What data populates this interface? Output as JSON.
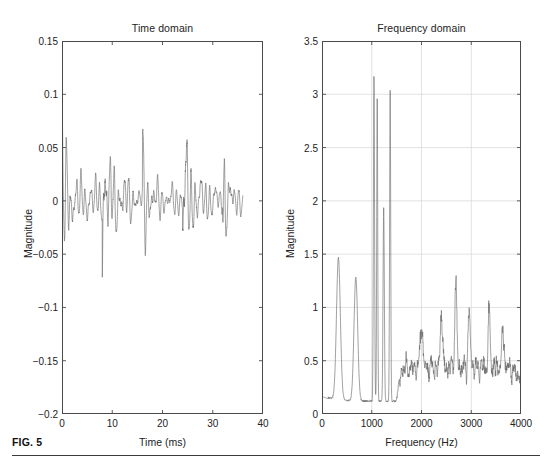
{
  "figure": {
    "caption_label": "FIG. 5",
    "background": "#ffffff",
    "line_color": "#6e6e6e",
    "axis_color": "#4a4a4a",
    "grid_color": "#d6d6d6",
    "text_color": "#232323"
  },
  "chart_data": [
    {
      "type": "line",
      "panel": "left",
      "title": "Time domain",
      "xlabel": "Time (ms)",
      "ylabel": "Magnitude",
      "xlim": [
        0,
        40
      ],
      "ylim": [
        -0.2,
        0.15
      ],
      "xticks": [
        0,
        10,
        20,
        30,
        40
      ],
      "xtick_labels": [
        "0",
        "10",
        "20",
        "30",
        "40"
      ],
      "yticks": [
        -0.2,
        -0.15,
        -0.1,
        -0.05,
        0,
        0.05,
        0.1,
        0.15
      ],
      "ytick_labels": [
        "-0.2",
        "-0.15",
        "-0.1",
        "-0.05",
        "0",
        "0.05",
        "0.1",
        "0.15"
      ],
      "grid": false,
      "series_name": "speech waveform",
      "x_sampling_ms": 0.075,
      "x_extent_ms": [
        0,
        36.0
      ],
      "description": "Dense oscillatory speech-like waveform, quasi-periodic pitch pulses, amplitude envelope between about -0.1 and +0.115, centered near 0.",
      "envelope_peaks_positive": [
        0.085,
        0.077,
        0.095,
        0.098,
        0.09,
        0.114,
        0.083,
        0.064,
        0.065,
        0.062,
        0.088,
        0.084,
        0.092,
        0.073,
        0.05
      ],
      "envelope_peaks_negative": [
        -0.055,
        -0.072,
        -0.063,
        -0.062,
        -0.088,
        -0.065,
        -0.1,
        -0.058,
        -0.066,
        -0.075,
        -0.077,
        -0.051
      ]
    },
    {
      "type": "line",
      "panel": "right",
      "title": "Frequency domain",
      "xlabel": "Frequency (Hz)",
      "ylabel": "Magnitude",
      "xlim": [
        0,
        4000
      ],
      "ylim": [
        0,
        3.5
      ],
      "xticks": [
        0,
        1000,
        2000,
        3000,
        4000
      ],
      "xtick_labels": [
        "0",
        "1000",
        "2000",
        "3000",
        "4000"
      ],
      "yticks": [
        0,
        0.5,
        1,
        1.5,
        2,
        2.5,
        3,
        3.5
      ],
      "ytick_labels": [
        "0",
        "0.5",
        "1",
        "1.5",
        "2",
        "2.5",
        "3",
        "3.5"
      ],
      "grid": true,
      "series_name": "magnitude spectrum",
      "description": "Magnitude spectrum with strong formant peaks near 330 Hz, 680 Hz, and a cluster of very tall narrow peaks near 1050-1400 Hz, then a noisy low-level region above 1500 Hz.",
      "major_peaks": [
        {
          "freq": 330,
          "magnitude": 1.33
        },
        {
          "freq": 680,
          "magnitude": 1.16
        },
        {
          "freq": 1045,
          "magnitude": 3.06
        },
        {
          "freq": 1110,
          "magnitude": 2.89
        },
        {
          "freq": 1240,
          "magnitude": 1.82
        },
        {
          "freq": 1370,
          "magnitude": 2.97
        },
        {
          "freq": 2000,
          "magnitude": 0.45
        },
        {
          "freq": 2400,
          "magnitude": 0.54
        },
        {
          "freq": 2690,
          "magnitude": 0.81
        },
        {
          "freq": 2960,
          "magnitude": 0.52
        },
        {
          "freq": 3360,
          "magnitude": 0.5
        },
        {
          "freq": 3640,
          "magnitude": 0.33
        }
      ],
      "baseline_noise_range": [
        0.05,
        0.5
      ]
    }
  ]
}
